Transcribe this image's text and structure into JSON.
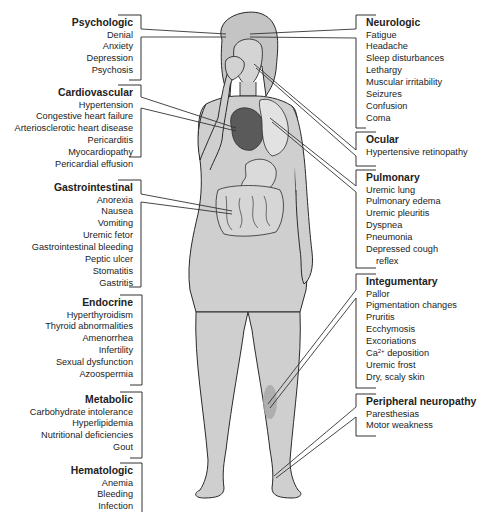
{
  "figure": {
    "left_groups": [
      {
        "id": "psychologic",
        "title": "Psychologic",
        "items": [
          "Denial",
          "Anxiety",
          "Depression",
          "Psychosis"
        ]
      },
      {
        "id": "cardiovascular",
        "title": "Cardiovascular",
        "items": [
          "Hypertension",
          "Congestive heart failure",
          "Arteriosclerotic heart disease",
          "Pericarditis",
          "Myocardiopathy",
          "Pericardial effusion"
        ]
      },
      {
        "id": "gastrointestinal",
        "title": "Gastrointestinal",
        "items": [
          "Anorexia",
          "Nausea",
          "Vomiting",
          "Uremic fetor",
          "Gastrointestinal bleeding",
          "Peptic ulcer",
          "Stomatitis",
          "Gastritis"
        ]
      },
      {
        "id": "endocrine",
        "title": "Endocrine",
        "items": [
          "Hyperthyroidism",
          "Thyroid abnormalities",
          "Amenorrhea",
          "Infertility",
          "Sexual dysfunction",
          "Azoospermia"
        ]
      },
      {
        "id": "metabolic",
        "title": "Metabolic",
        "items": [
          "Carbohydrate intolerance",
          "Hyperlipidemia",
          "Nutritional deficiencies",
          "Gout"
        ]
      },
      {
        "id": "hematologic",
        "title": "Hematologic",
        "items": [
          "Anemia",
          "Bleeding",
          "Infection"
        ]
      }
    ],
    "right_groups": [
      {
        "id": "neurologic",
        "title": "Neurologic",
        "items": [
          "Fatigue",
          "Headache",
          "Sleep disturbances",
          "Lethargy",
          "Muscular irritability",
          "Seizures",
          "Confusion",
          "Coma"
        ]
      },
      {
        "id": "ocular",
        "title": "Ocular",
        "items": [
          "Hypertensive retinopathy"
        ]
      },
      {
        "id": "pulmonary",
        "title": "Pulmonary",
        "items": [
          "Uremic lung",
          "Pulmonary edema",
          "Uremic pleuritis",
          "Dyspnea",
          "Pneumonia",
          "Depressed cough",
          "reflex"
        ]
      },
      {
        "id": "integumentary",
        "title": "Integumentary",
        "items": [
          "Pallor",
          "Pigmentation changes",
          "Pruritis",
          "Ecchymosis",
          "Excoriations",
          "Ca",
          "Uremic frost",
          "Dry, scaly skin"
        ],
        "ca_superscript": "2+",
        "ca_suffix": " deposition"
      },
      {
        "id": "peripheral_neuropathy",
        "title": "Peripheral neuropathy",
        "items": [
          "Paresthesias",
          "Motor weakness"
        ]
      }
    ],
    "colors": {
      "skin": "#cfcfcf",
      "outline": "#2a2a2a",
      "heart": "#5a5a5a",
      "lung": "#e2e2e2",
      "bruise": "#a8a8a8",
      "leader_line": "#333333"
    }
  }
}
